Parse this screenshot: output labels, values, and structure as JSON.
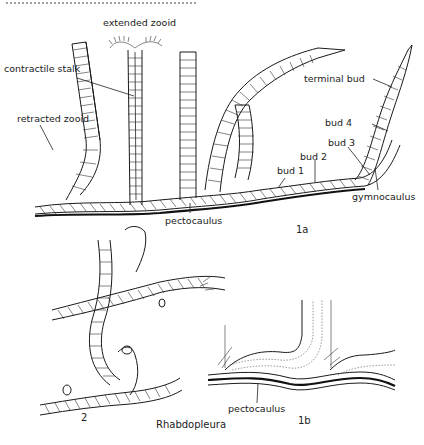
{
  "figure": {
    "title": "Rhabdopleura",
    "panels": [
      {
        "id": "1a",
        "number_label": "1a",
        "labels": [
          {
            "key": "extended_zooid",
            "text": "extended zooid"
          },
          {
            "key": "contractile_stalk",
            "text": "contractile stalk"
          },
          {
            "key": "retracted_zooid",
            "text": "retracted zooid"
          },
          {
            "key": "terminal_bud",
            "text": "terminal bud"
          },
          {
            "key": "bud4",
            "text": "bud 4"
          },
          {
            "key": "bud3",
            "text": "bud 3"
          },
          {
            "key": "bud2",
            "text": "bud 2"
          },
          {
            "key": "bud1",
            "text": "bud 1"
          },
          {
            "key": "gymnocaulus",
            "text": "gymnocaulus"
          },
          {
            "key": "pectocaulus",
            "text": "pectocaulus"
          }
        ]
      },
      {
        "id": "2",
        "number_label": "2",
        "labels": []
      },
      {
        "id": "1b",
        "number_label": "1b",
        "labels": [
          {
            "key": "pectocaulus",
            "text": "pectocaulus"
          }
        ]
      }
    ]
  },
  "colors": {
    "ink": "#1a1a1a",
    "background": "#ffffff"
  }
}
